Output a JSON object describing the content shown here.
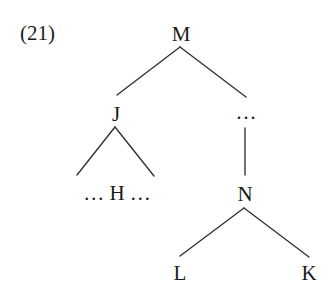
{
  "example_number": "(21)",
  "tree": {
    "root": {
      "label": "M"
    },
    "nodes": {
      "j": {
        "label": "J"
      },
      "j_child": {
        "label": "… H …"
      },
      "ellipsis": {
        "label": "…"
      },
      "n": {
        "label": "N"
      },
      "l": {
        "label": "L"
      },
      "k": {
        "label": "K"
      }
    },
    "edges": [
      [
        "M",
        "J"
      ],
      [
        "M",
        "…"
      ],
      [
        "J",
        "… H …"
      ],
      [
        "…",
        "N"
      ],
      [
        "N",
        "L"
      ],
      [
        "N",
        "K"
      ]
    ]
  },
  "colors": {
    "ink": "#1a1a1a",
    "line": "#333333",
    "background": "#ffffff"
  }
}
